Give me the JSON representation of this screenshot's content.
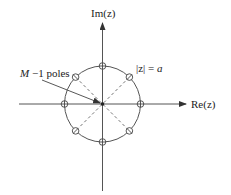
{
  "diagram": {
    "type": "z-plane pole-zero plot",
    "axes": {
      "real_label": "Re(z)",
      "imag_label": "Im(z)"
    },
    "circle_label": "|z| = a",
    "circle_label_parts": {
      "lhs": "|z| = ",
      "rhs": "a"
    },
    "pole_annotation": "M −1 poles",
    "pole_annotation_parts": {
      "var": "M",
      "rest": " −1 poles"
    },
    "zeros": {
      "count": 8,
      "angles_deg": [
        0,
        45,
        90,
        135,
        180,
        225,
        270,
        315
      ],
      "marker": "open circle"
    },
    "origin_poles": "M-1 poles at origin",
    "colors": {
      "stroke": "#555555",
      "text": "#222222",
      "dashed": "#666666"
    }
  }
}
